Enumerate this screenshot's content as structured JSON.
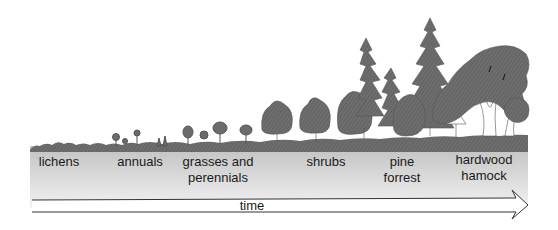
{
  "diagram": {
    "stages": [
      {
        "id": "lichens",
        "line1": "lichens",
        "line2": ""
      },
      {
        "id": "annuals",
        "line1": "annuals",
        "line2": ""
      },
      {
        "id": "grasses-perennials",
        "line1": "grasses and",
        "line2": "perennials"
      },
      {
        "id": "shrubs",
        "line1": "shrubs",
        "line2": ""
      },
      {
        "id": "pine-forest",
        "line1": "pine",
        "line2": "forrest"
      },
      {
        "id": "hardwood-hammock",
        "line1": "hardwood",
        "line2": "hamock"
      }
    ],
    "axis": {
      "label": "time",
      "direction": "left-to-right"
    },
    "colors": {
      "vegetation": "#6b6b6b",
      "vegetation_dark": "#5a5a5a",
      "ground_top": "#c4c4c4",
      "ground_bottom": "#f0f0f0",
      "arrow_stroke": "#333333",
      "text": "#1a1a1a"
    }
  }
}
